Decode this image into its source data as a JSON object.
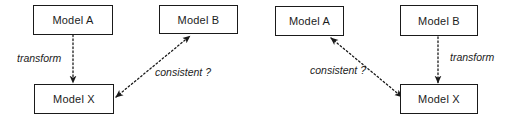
{
  "figure": {
    "type": "diagram",
    "background_color": "#ffffff",
    "line_color": "#1a1a1a",
    "edge_style": "dotted",
    "panels": [
      {
        "id": "left-panel",
        "name": "left-diagram",
        "nodes": [
          {
            "id": "left-model-a",
            "label": "Model A",
            "x": 33,
            "y": 5,
            "w": 80,
            "h": 30
          },
          {
            "id": "left-model-b",
            "label": "Model B",
            "x": 159,
            "y": 5,
            "w": 79,
            "h": 29
          },
          {
            "id": "left-model-x",
            "label": "Model X",
            "x": 34,
            "y": 84,
            "w": 80,
            "h": 30
          }
        ],
        "edges": [
          {
            "id": "left-transform-edge",
            "label": "transform",
            "from": "left-model-a",
            "to": "left-model-x",
            "arrowheads": "end",
            "x1": 73,
            "y1": 35,
            "x2": 73,
            "y2": 83,
            "label_x": 17,
            "label_y": 52
          },
          {
            "id": "left-consistent-edge",
            "label": "consistent ?",
            "from": "left-model-x",
            "to": "left-model-b",
            "arrowheads": "both",
            "x1": 116,
            "y1": 97,
            "x2": 190,
            "y2": 36,
            "label_x": 155,
            "label_y": 66
          }
        ]
      },
      {
        "id": "right-panel",
        "name": "right-diagram",
        "nodes": [
          {
            "id": "right-model-a",
            "label": "Model A",
            "x": 275,
            "y": 6,
            "w": 69,
            "h": 30
          },
          {
            "id": "right-model-b",
            "label": "Model B",
            "x": 400,
            "y": 5,
            "w": 78,
            "h": 31
          },
          {
            "id": "right-model-x",
            "label": "Model X",
            "x": 400,
            "y": 84,
            "w": 78,
            "h": 30
          }
        ],
        "edges": [
          {
            "id": "right-transform-edge",
            "label": "transform",
            "from": "right-model-b",
            "to": "right-model-x",
            "arrowheads": "end",
            "x1": 438,
            "y1": 37,
            "x2": 438,
            "y2": 83,
            "label_x": 450,
            "label_y": 51
          },
          {
            "id": "right-consistent-edge",
            "label": "consistent ?",
            "from": "right-model-x",
            "to": "right-model-a",
            "arrowheads": "both",
            "x1": 331,
            "y1": 38,
            "x2": 402,
            "y2": 97,
            "label_x": 310,
            "label_y": 64
          }
        ]
      }
    ]
  }
}
